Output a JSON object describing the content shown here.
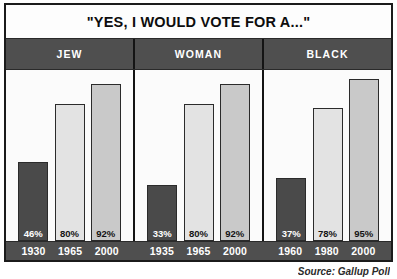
{
  "chart_data": {
    "type": "bar",
    "title": "\"YES, I WOULD VOTE FOR A...\"",
    "xlabel": "",
    "ylabel": "",
    "ylim": [
      0,
      100
    ],
    "grid": false,
    "legend": "none",
    "categories": [
      "JEW",
      "WOMAN",
      "BLACK"
    ],
    "groups": [
      {
        "name": "JEW",
        "x": [
          "1930",
          "1965",
          "2000"
        ],
        "values": [
          46,
          80,
          92
        ],
        "value_labels": [
          "46%",
          "80%",
          "92%"
        ]
      },
      {
        "name": "WOMAN",
        "x": [
          "1935",
          "1965",
          "2000"
        ],
        "values": [
          33,
          80,
          92
        ],
        "value_labels": [
          "33%",
          "80%",
          "92%"
        ]
      },
      {
        "name": "BLACK",
        "x": [
          "1960",
          "1980",
          "2000"
        ],
        "values": [
          37,
          78,
          95
        ],
        "value_labels": [
          "37%",
          "78%",
          "95%"
        ]
      }
    ],
    "series": [
      {
        "name": "earliest-year",
        "values": [
          46,
          33,
          37
        ],
        "color": "#4a4a4a"
      },
      {
        "name": "middle-year",
        "values": [
          80,
          80,
          78
        ],
        "color": "#e3e3e3"
      },
      {
        "name": "latest-year",
        "values": [
          92,
          92,
          95
        ],
        "color": "#c9c9c9"
      }
    ],
    "annotations": [
      "Source: Gallup Poll"
    ]
  },
  "figure": {
    "title": "\"YES, I WOULD VOTE FOR A...\"",
    "source_note": "Source: Gallup Poll"
  },
  "colors": {
    "frame": "#1b1b1b",
    "band": "#4f4f4f",
    "band_text": "#ffffff",
    "bar_dark": "#4a4a4a",
    "bar_light": "#e3e3e3",
    "bar_medium": "#c9c9c9",
    "plot_background": "#fbfbfb"
  }
}
